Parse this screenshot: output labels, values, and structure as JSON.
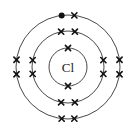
{
  "diagram": {
    "type": "bohr-electron-shell",
    "element_symbol": "Cl",
    "nucleus_label": "Cl",
    "center": [
      68,
      67
    ],
    "shells": [
      {
        "name": "shell-1",
        "radius": 19,
        "electrons": [
          {
            "kind": "cross",
            "angle": 90
          },
          {
            "kind": "cross",
            "angle": 270
          }
        ]
      },
      {
        "name": "shell-2",
        "radius": 36,
        "electrons": [
          {
            "kind": "cross",
            "angle": 79
          },
          {
            "kind": "cross",
            "angle": 101
          },
          {
            "kind": "cross",
            "angle": 169
          },
          {
            "kind": "cross",
            "angle": 191
          },
          {
            "kind": "cross",
            "angle": 259
          },
          {
            "kind": "cross",
            "angle": 281
          },
          {
            "kind": "cross",
            "angle": 349
          },
          {
            "kind": "cross",
            "angle": 11
          }
        ]
      },
      {
        "name": "shell-3",
        "radius": 52,
        "electrons": [
          {
            "kind": "dot",
            "angle": 97
          },
          {
            "kind": "cross",
            "angle": 83
          },
          {
            "kind": "cross",
            "angle": 172
          },
          {
            "kind": "cross",
            "angle": 188
          },
          {
            "kind": "cross",
            "angle": 263
          },
          {
            "kind": "cross",
            "angle": 277
          },
          {
            "kind": "cross",
            "angle": 352
          },
          {
            "kind": "cross",
            "angle": 8
          }
        ]
      }
    ],
    "colors": {
      "line": "#333333",
      "marker": "#111111",
      "background": "#ffffff"
    }
  }
}
